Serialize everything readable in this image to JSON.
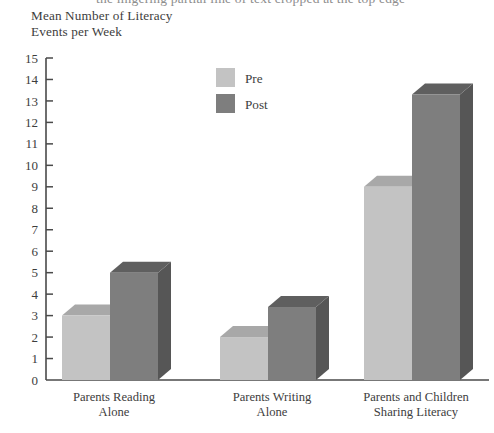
{
  "figure": {
    "clipped_top_text": "the lingering partial line of text cropped at the top edge",
    "axis_title": "Mean Number of Literacy\nEvents per Week"
  },
  "legend": {
    "position": "top-center-right",
    "entries": [
      {
        "label": "Pre",
        "color": "#c3c3c3"
      },
      {
        "label": "Post",
        "color": "#7e7e7e"
      }
    ]
  },
  "colors": {
    "pre_front": "#c3c3c3",
    "pre_top": "#a8a8a8",
    "pre_side": "#9a9a9a",
    "post_front": "#7e7e7e",
    "post_top": "#5f5f5f",
    "post_side": "#565656",
    "axis": "#4a4a4a",
    "text": "#3d3d3d"
  },
  "chart_data": {
    "type": "bar",
    "title": "",
    "xlabel": "",
    "ylabel": "Mean Number of Literacy Events per Week",
    "ylim": [
      0,
      15
    ],
    "ytick_step": 1,
    "yticks": [
      0,
      1,
      2,
      3,
      4,
      5,
      6,
      7,
      8,
      9,
      10,
      11,
      12,
      13,
      14,
      15
    ],
    "grid": false,
    "three_d": true,
    "legend_position": "top-center",
    "categories": [
      "Parents Reading\nAlone",
      "Parents Writing\nAlone",
      "Parents and Children\nSharing Literacy"
    ],
    "series": [
      {
        "name": "Pre",
        "color": "#c3c3c3",
        "values": [
          3,
          2,
          9
        ]
      },
      {
        "name": "Post",
        "color": "#7e7e7e",
        "values": [
          5,
          3.4,
          13.3
        ]
      }
    ]
  }
}
